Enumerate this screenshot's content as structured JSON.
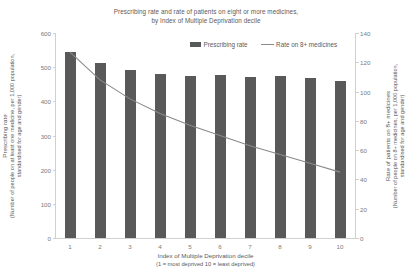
{
  "chart_data": {
    "type": "bar",
    "title": "Prescribing rate and rate of patients on eight or more medicines, by Index of Multiple Deprivation decile",
    "title_line1": "Prescribing rate and rate of patients on eight or more medicines,",
    "title_line2": "by Index of Multiple Deprivation decile",
    "categories": [
      "1",
      "2",
      "3",
      "4",
      "5",
      "6",
      "7",
      "8",
      "9",
      "10"
    ],
    "series": [
      {
        "name": "Prescribing rate",
        "type": "bar",
        "axis": "left",
        "color": "#595959",
        "values": [
          545,
          512,
          492,
          480,
          473,
          477,
          470,
          475,
          468,
          460
        ]
      },
      {
        "name": "Rate on 8+ medicines",
        "type": "line",
        "axis": "right",
        "color": "#8a8a8a",
        "values": [
          127,
          108,
          95,
          85,
          77,
          70,
          63,
          57,
          51,
          45
        ]
      }
    ],
    "xlabel": "Index of Multiple Deprivation decile (1 = most deprived 10 = least deprived)",
    "xlabel_line1": "Index of Multiple Deprivation decile",
    "xlabel_line2": "(1 = most deprived 10 = least deprived)",
    "ylabel": "Prescribing rate (Number of people on at least one medicine, per 1,000 population, standardised for age and gender)",
    "ylabel_line1": "Prescribing rate",
    "ylabel_line2": "(Number of people on at least one medicine, per 1,000 population,",
    "ylabel_line3": "standardised for age and gender)",
    "y2label": "Rate of patients on 8+ medicines (Number of people on 8+ medicines, per 1,000 population, standardised for age and gender)",
    "y2label_line1": "Rate of patients on 8+ medicines",
    "y2label_line2": "(Number of people on 8+ medicines, per 1,000 population,",
    "y2label_line3": "standardised for age and gender)",
    "ylim": [
      0,
      600
    ],
    "yticks": [
      "0",
      "100",
      "200",
      "300",
      "400",
      "500",
      "600"
    ],
    "y2lim": [
      0,
      140
    ],
    "y2ticks": [
      "0",
      "20",
      "40",
      "60",
      "80",
      "100",
      "120",
      "140"
    ],
    "grid": false,
    "legend_position": "top-center",
    "legend": [
      {
        "label": "Prescribing rate",
        "marker": "bar-swatch",
        "color": "#595959"
      },
      {
        "label": "Rate on 8+ medicines",
        "marker": "line-swatch",
        "color": "#8a8a8a"
      }
    ]
  }
}
